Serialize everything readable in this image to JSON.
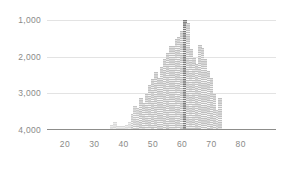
{
  "chart_data": {
    "type": "bar",
    "title": "",
    "subtitle": "",
    "xlabel": "",
    "ylabel": "",
    "grid": true,
    "legend": "none",
    "y_axis_inverted": true,
    "xlim": [
      15,
      85
    ],
    "ylim": [
      4000,
      600
    ],
    "y_ticks": [
      1000,
      2000,
      3000,
      4000
    ],
    "y_tick_labels": [
      "1,000",
      "2,000",
      "3,000",
      "4,000"
    ],
    "x_ticks": [
      20,
      30,
      40,
      50,
      60,
      70,
      80
    ],
    "x_tick_labels": [
      "20",
      "30",
      "40",
      "50",
      "60",
      "70",
      "80"
    ],
    "highlight_x": 61,
    "highlight_value": 1000,
    "categories": [
      36,
      37,
      38,
      39,
      40,
      41,
      42,
      43,
      44,
      45,
      46,
      47,
      48,
      49,
      50,
      51,
      52,
      53,
      54,
      55,
      56,
      57,
      58,
      59,
      60,
      61,
      62,
      63,
      64,
      65,
      66,
      67,
      68,
      69,
      70,
      71,
      72,
      73
    ],
    "values": [
      3870,
      3790,
      3900,
      3880,
      3880,
      3870,
      3780,
      3560,
      3340,
      3390,
      3140,
      3250,
      3020,
      2760,
      2600,
      2420,
      2590,
      2270,
      2070,
      1910,
      1700,
      1700,
      1530,
      1450,
      1300,
      1000,
      1080,
      1790,
      2030,
      2200,
      1690,
      1760,
      2060,
      2390,
      2580,
      3010,
      3460,
      3130
    ]
  },
  "colors": {
    "bar": "#bfbfbf",
    "bar_faint": "#d8d8d8",
    "bar_highlight": "#7a7a7a",
    "grid": "#e3e3e3",
    "axis": "#8d8d8b",
    "tick_text": "#8a8a88",
    "background": "#ffffff"
  }
}
